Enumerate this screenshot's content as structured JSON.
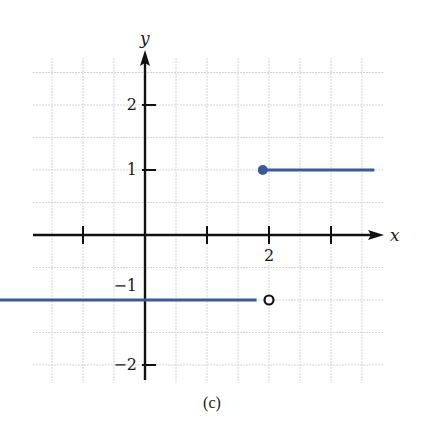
{
  "chart_data": {
    "type": "line",
    "title": "",
    "caption": "(c)",
    "xlabel": "x",
    "ylabel": "y",
    "xlim": [
      -3.6,
      3.8
    ],
    "ylim": [
      -2.4,
      2.6
    ],
    "grid": true,
    "grid_step": 0.5,
    "x_ticks": [
      -1,
      1,
      2,
      3
    ],
    "x_tick_labels": [
      {
        "value": 2,
        "label": "2"
      }
    ],
    "y_ticks": [
      -2,
      -1,
      1,
      2
    ],
    "y_tick_labels": [
      {
        "value": 2,
        "label": "2"
      },
      {
        "value": 1,
        "label": "1"
      },
      {
        "value": -1,
        "label": "−1"
      },
      {
        "value": -2,
        "label": "−2"
      }
    ],
    "series": [
      {
        "name": "left piece",
        "x": [
          -3.6,
          1.8
        ],
        "y": [
          -1,
          -1
        ],
        "color": "#3a5a99"
      },
      {
        "name": "right piece",
        "x": [
          1.9,
          3.7
        ],
        "y": [
          1,
          1
        ],
        "color": "#3a5a99"
      }
    ],
    "points": [
      {
        "x": 1.9,
        "y": 1,
        "style": "filled",
        "color": "#3a5a99"
      },
      {
        "x": 2,
        "y": -1,
        "style": "open",
        "color": "#111111"
      }
    ],
    "legend": null
  }
}
